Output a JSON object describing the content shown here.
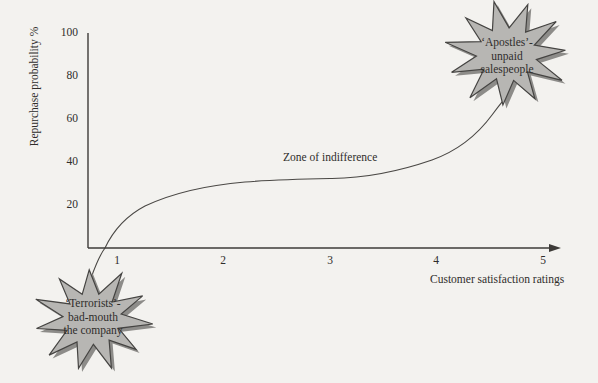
{
  "colors": {
    "background": "#f3f2ef",
    "ink": "#3d3b38",
    "star_fill": "#b7b6b3",
    "star_stroke": "#454442",
    "star_shadow": "#8d8c89",
    "text": "#2f2d2b"
  },
  "chart_data": {
    "type": "line",
    "title": "",
    "xlabel": "Customer satisfaction ratings",
    "ylabel": "Repurchase probability %",
    "x_tick_labels": [
      "1",
      "2",
      "3",
      "4",
      "5"
    ],
    "y_tick_labels": [
      "100",
      "80",
      "60",
      "40",
      "20"
    ],
    "xlim": [
      0.7,
      5.2
    ],
    "ylim": [
      0,
      100
    ],
    "grid": false,
    "legend": "none",
    "annotations": [
      {
        "text": "Zone of indifference",
        "x": 2.6,
        "y": 42
      },
      {
        "text": "‘Apostles’- unpaid salespeople",
        "x": 4.65,
        "y": 90,
        "shape": "starburst"
      },
      {
        "text": "‘Terrorists’- bad-mouth the company",
        "x": 0.78,
        "y": -33,
        "shape": "starburst"
      }
    ],
    "series": [
      {
        "name": "repurchase-probability-vs-satisfaction-curve",
        "x": [
          0.77,
          0.9,
          1.0,
          1.3,
          1.6,
          2.0,
          2.5,
          3.0,
          3.5,
          4.0,
          4.3,
          4.55,
          4.7
        ],
        "y": [
          -13,
          -5,
          0,
          19,
          22,
          27,
          31,
          32,
          34,
          41,
          52,
          63,
          72
        ]
      }
    ]
  },
  "callouts": {
    "apostles": {
      "line1": "‘Apostles’-",
      "line2": "unpaid",
      "line3": "salespeople"
    },
    "terrorists": {
      "line1": "‘Terrorists’-",
      "line2": "bad-mouth",
      "line3": "the company"
    }
  }
}
